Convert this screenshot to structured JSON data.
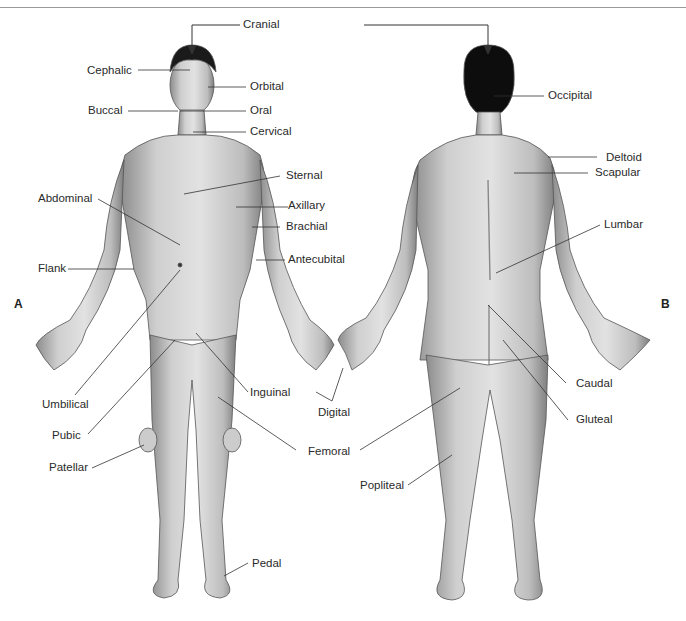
{
  "figure": {
    "panel_labels": {
      "anterior": "A",
      "posterior": "B"
    },
    "top_label": "Cranial",
    "anterior_labels": {
      "cephalic": "Cephalic",
      "orbital": "Orbital",
      "buccal": "Buccal",
      "oral": "Oral",
      "cervical": "Cervical",
      "sternal": "Sternal",
      "abdominal": "Abdominal",
      "axillary": "Axillary",
      "brachial": "Brachial",
      "flank": "Flank",
      "antecubital": "Antecubital",
      "umbilical": "Umbilical",
      "inguinal": "Inguinal",
      "digital": "Digital",
      "pubic": "Pubic",
      "femoral": "Femoral",
      "patellar": "Patellar",
      "pedal": "Pedal"
    },
    "posterior_labels": {
      "occipital": "Occipital",
      "deltoid": "Deltoid",
      "scapular": "Scapular",
      "lumbar": "Lumbar",
      "caudal": "Caudal",
      "gluteal": "Gluteal",
      "popliteal": "Popliteal"
    }
  }
}
